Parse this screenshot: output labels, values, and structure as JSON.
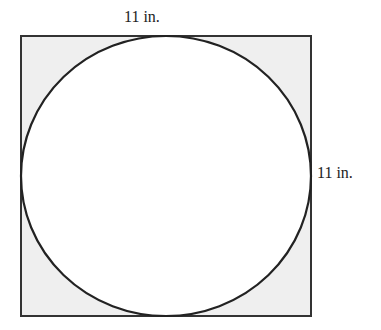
{
  "diagram": {
    "top_label": "11 in.",
    "right_label": "11 in.",
    "colors": {
      "shade": "#efefef",
      "circle_fill": "#ffffff",
      "stroke": "#222222"
    }
  }
}
